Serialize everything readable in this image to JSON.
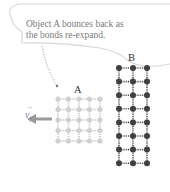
{
  "caption": {
    "line1": "Object A bounces back as",
    "line2": "the bonds re-expand."
  },
  "objects": {
    "a_label": "A",
    "b_label": "B",
    "a_grid": {
      "cols": 5,
      "rows": 5
    },
    "b_grid": {
      "cols": 3,
      "rows": 8
    }
  },
  "velocity": {
    "symbol": "v",
    "subscript": "f",
    "direction": "left"
  },
  "colors": {
    "callout_line": "#c8c8c8",
    "arrow": "#9a9a9a",
    "atom_a": "#d0d0d0",
    "atom_b": "#404040",
    "velocity_label": "#7d7dc0"
  }
}
